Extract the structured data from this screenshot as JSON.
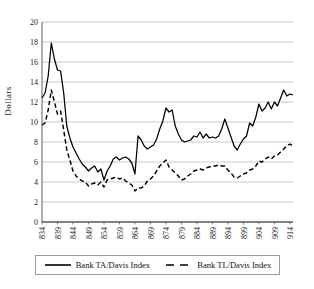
{
  "chart_data": {
    "type": "line",
    "title": "",
    "xlabel": "",
    "ylabel": "Dollars",
    "ylim": [
      0,
      20
    ],
    "ytick_step": 2,
    "yticks": [
      0,
      2,
      4,
      6,
      8,
      10,
      12,
      14,
      16,
      18,
      20
    ],
    "xlim": [
      1834,
      1915
    ],
    "xticks": [
      1834,
      1839,
      1844,
      1849,
      1854,
      1859,
      1864,
      1869,
      1874,
      1879,
      1884,
      1889,
      1894,
      1899,
      1904,
      1909,
      1914
    ],
    "grid": "horizontal",
    "legend_position": "bottom",
    "series": [
      {
        "name": "Bank TA/Davis Index",
        "style": "solid",
        "color": "#000000",
        "x": [
          1834,
          1835,
          1836,
          1837,
          1838,
          1839,
          1840,
          1841,
          1842,
          1843,
          1844,
          1845,
          1846,
          1847,
          1848,
          1849,
          1850,
          1851,
          1852,
          1853,
          1854,
          1855,
          1856,
          1857,
          1858,
          1859,
          1860,
          1861,
          1862,
          1863,
          1864,
          1865,
          1866,
          1867,
          1868,
          1869,
          1870,
          1871,
          1872,
          1873,
          1874,
          1875,
          1876,
          1877,
          1878,
          1879,
          1880,
          1881,
          1882,
          1883,
          1884,
          1885,
          1886,
          1887,
          1888,
          1889,
          1890,
          1891,
          1892,
          1893,
          1894,
          1895,
          1896,
          1897,
          1898,
          1899,
          1900,
          1901,
          1902,
          1903,
          1904,
          1905,
          1906,
          1907,
          1908,
          1909,
          1910,
          1911,
          1912,
          1913,
          1914,
          1915
        ],
        "values": [
          12.4,
          12.9,
          14.6,
          17.9,
          16.3,
          15.2,
          15.1,
          12.9,
          9.6,
          8.4,
          7.5,
          6.9,
          6.3,
          5.8,
          5.5,
          5.1,
          5.4,
          5.6,
          5.0,
          5.3,
          4.2,
          5.1,
          5.6,
          6.3,
          6.5,
          6.2,
          6.4,
          6.5,
          6.3,
          5.9,
          4.8,
          8.6,
          8.2,
          7.6,
          7.3,
          7.5,
          7.7,
          8.3,
          9.3,
          10.1,
          11.4,
          11.0,
          11.2,
          9.6,
          8.8,
          8.2,
          8.0,
          8.1,
          8.2,
          8.6,
          8.5,
          9.0,
          8.4,
          8.8,
          8.4,
          8.5,
          8.4,
          8.6,
          9.3,
          10.3,
          9.4,
          8.5,
          7.6,
          7.2,
          7.8,
          8.3,
          8.6,
          9.9,
          9.6,
          10.5,
          11.8,
          11.1,
          11.4,
          12.0,
          11.3,
          12.0,
          11.6,
          12.4,
          13.2,
          12.6,
          12.8,
          12.7
        ]
      },
      {
        "name": "Bank TL/Davis Index",
        "style": "dashed",
        "color": "#000000",
        "x": [
          1834,
          1835,
          1836,
          1837,
          1838,
          1839,
          1840,
          1841,
          1842,
          1843,
          1844,
          1845,
          1846,
          1847,
          1848,
          1849,
          1850,
          1851,
          1852,
          1853,
          1854,
          1855,
          1856,
          1857,
          1858,
          1859,
          1860,
          1861,
          1862,
          1863,
          1864,
          1865,
          1866,
          1867,
          1868,
          1869,
          1870,
          1871,
          1872,
          1873,
          1874,
          1875,
          1876,
          1877,
          1878,
          1879,
          1880,
          1881,
          1882,
          1883,
          1884,
          1885,
          1886,
          1887,
          1888,
          1889,
          1890,
          1891,
          1892,
          1893,
          1894,
          1895,
          1896,
          1897,
          1898,
          1899,
          1900,
          1901,
          1902,
          1903,
          1904,
          1905,
          1906,
          1907,
          1908,
          1909,
          1910,
          1911,
          1912,
          1913,
          1914,
          1915
        ],
        "values": [
          9.7,
          9.9,
          11.2,
          13.2,
          12.0,
          10.8,
          11.1,
          9.2,
          7.2,
          6.2,
          5.1,
          4.6,
          4.3,
          4.1,
          4.0,
          3.6,
          3.8,
          3.9,
          3.7,
          4.0,
          3.5,
          4.2,
          4.3,
          4.4,
          4.5,
          4.3,
          4.4,
          4.1,
          3.9,
          3.7,
          3.1,
          3.4,
          3.4,
          3.6,
          4.1,
          4.3,
          4.6,
          5.1,
          5.6,
          5.9,
          6.2,
          5.5,
          5.2,
          4.9,
          4.6,
          4.2,
          4.3,
          4.6,
          4.8,
          5.1,
          5.2,
          5.3,
          5.2,
          5.4,
          5.5,
          5.6,
          5.6,
          5.7,
          5.6,
          5.6,
          5.2,
          4.9,
          4.5,
          4.4,
          4.6,
          4.8,
          4.9,
          5.2,
          5.3,
          5.6,
          6.1,
          6.0,
          6.3,
          6.5,
          6.3,
          6.6,
          6.7,
          7.0,
          7.3,
          7.6,
          7.8,
          7.6
        ]
      }
    ]
  },
  "axis": {
    "ylabel": "Dollars",
    "ytick_labels": [
      "0",
      "2",
      "4",
      "6",
      "8",
      "10",
      "12",
      "14",
      "16",
      "18",
      "20"
    ],
    "xtick_labels": [
      "1834",
      "1839",
      "1844",
      "1849",
      "1854",
      "1859",
      "1864",
      "1869",
      "1874",
      "1879",
      "1884",
      "1889",
      "1894",
      "1899",
      "1904",
      "1909",
      "1914"
    ]
  },
  "legend": {
    "items": [
      {
        "label": "Bank TA/Davis Index",
        "style": "solid"
      },
      {
        "label": "Bank TL/Davis Index",
        "style": "dashed"
      }
    ]
  },
  "colors": {
    "line": "#000000",
    "grid": "#b3b3b3",
    "axis": "#4d4d4d",
    "text": "#1a1a1a",
    "legend_border": "#9a9a9a",
    "background": "#ffffff"
  }
}
